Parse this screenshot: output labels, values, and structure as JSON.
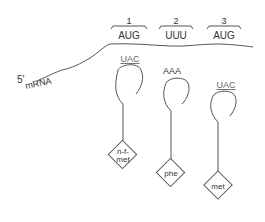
{
  "diagram": {
    "mrna_label": "mRNA",
    "five_prime_label": "5′",
    "codons": [
      {
        "position": "1",
        "sequence": "AUG"
      },
      {
        "position": "2",
        "sequence": "UUU"
      },
      {
        "position": "3",
        "sequence": "AUG"
      }
    ],
    "trnas": [
      {
        "anticodon": "UAC",
        "amino_acid_line1": "n-f-",
        "amino_acid_line2": "met"
      },
      {
        "anticodon": "AAA",
        "amino_acid": "phe"
      },
      {
        "anticodon": "UAC",
        "amino_acid": "met"
      }
    ],
    "colors": {
      "line": "#555555",
      "text": "#333333",
      "anticodon_text": "#666666",
      "background": "#ffffff"
    }
  }
}
